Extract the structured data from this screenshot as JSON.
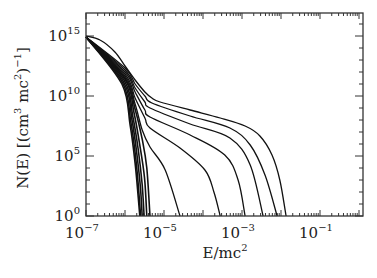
{
  "chart_data": {
    "type": "line",
    "title": "",
    "xlabel": "E/mc^2",
    "ylabel": "N(E) [(cm^3 mc^2)^-1]",
    "xscale": "log",
    "yscale": "log",
    "xlim": [
      1e-07,
      1.5
    ],
    "ylim": [
      1,
      3e+16
    ],
    "grid": false,
    "legend": null,
    "x_ticks": [
      {
        "value": 1e-07,
        "base": "10",
        "exp": "−7"
      },
      {
        "value": 1e-05,
        "base": "10",
        "exp": "−5"
      },
      {
        "value": 0.001,
        "base": "10",
        "exp": "−3"
      },
      {
        "value": 0.1,
        "base": "10",
        "exp": "−1"
      }
    ],
    "y_ticks": [
      {
        "value": 1,
        "base": "10",
        "exp": "0"
      },
      {
        "value": 100000.0,
        "base": "10",
        "exp": "5"
      },
      {
        "value": 10000000000.0,
        "base": "10",
        "exp": "10"
      },
      {
        "value": 1000000000000000.0,
        "base": "10",
        "exp": "15"
      }
    ],
    "series_units": "points given as [log10(E/mc^2), log10(N)]",
    "series": [
      {
        "name": "curve-1",
        "points": [
          [
            -7.0,
            15.0
          ],
          [
            -6.64,
            14.67
          ],
          [
            -6.26,
            13.67
          ],
          [
            -6.0,
            12.5
          ],
          [
            -5.74,
            11.33
          ],
          [
            -5.49,
            10.33
          ],
          [
            -5.31,
            9.83
          ],
          [
            -5.1,
            9.5
          ],
          [
            -4.33,
            8.83
          ],
          [
            -3.56,
            8.17
          ],
          [
            -2.92,
            7.5
          ],
          [
            -2.54,
            6.67
          ],
          [
            -2.23,
            5.08
          ],
          [
            -2.03,
            3.0
          ],
          [
            -1.87,
            0.0
          ]
        ]
      },
      {
        "name": "curve-2",
        "points": [
          [
            -7.0,
            14.92
          ],
          [
            -6.0,
            12.33
          ],
          [
            -5.74,
            11.0
          ],
          [
            -5.49,
            10.0
          ],
          [
            -5.31,
            9.42
          ],
          [
            -4.33,
            8.33
          ],
          [
            -3.31,
            7.33
          ],
          [
            -2.79,
            5.92
          ],
          [
            -2.41,
            3.42
          ],
          [
            -2.1,
            0.0
          ]
        ]
      },
      {
        "name": "curve-3",
        "points": [
          [
            -7.0,
            14.92
          ],
          [
            -6.0,
            12.17
          ],
          [
            -5.74,
            10.67
          ],
          [
            -5.49,
            9.5
          ],
          [
            -5.36,
            9.0
          ],
          [
            -4.33,
            7.67
          ],
          [
            -3.31,
            6.5
          ],
          [
            -2.79,
            4.25
          ],
          [
            -2.46,
            0.0
          ]
        ]
      },
      {
        "name": "curve-4",
        "points": [
          [
            -7.0,
            14.92
          ],
          [
            -6.0,
            12.0
          ],
          [
            -5.74,
            10.33
          ],
          [
            -5.49,
            8.83
          ],
          [
            -5.36,
            8.25
          ],
          [
            -4.33,
            6.75
          ],
          [
            -3.44,
            5.08
          ],
          [
            -3.1,
            3.0
          ],
          [
            -2.92,
            0.0
          ]
        ]
      },
      {
        "name": "curve-5",
        "points": [
          [
            -7.0,
            14.92
          ],
          [
            -6.0,
            11.83
          ],
          [
            -5.74,
            9.83
          ],
          [
            -5.49,
            8.17
          ],
          [
            -5.36,
            7.33
          ],
          [
            -4.59,
            5.67
          ],
          [
            -3.95,
            3.83
          ],
          [
            -3.72,
            2.0
          ],
          [
            -3.56,
            0.0
          ]
        ]
      },
      {
        "name": "curve-6",
        "points": [
          [
            -7.0,
            14.92
          ],
          [
            -6.0,
            11.67
          ],
          [
            -5.74,
            9.33
          ],
          [
            -5.56,
            7.17
          ],
          [
            -5.36,
            5.75
          ],
          [
            -4.97,
            3.83
          ],
          [
            -4.59,
            0.0
          ]
        ]
      },
      {
        "name": "curve-7",
        "points": [
          [
            -7.0,
            14.92
          ],
          [
            -6.0,
            11.5
          ],
          [
            -5.74,
            8.9
          ],
          [
            -5.56,
            6.4
          ],
          [
            -5.44,
            4.0
          ],
          [
            -5.36,
            0.0
          ]
        ]
      },
      {
        "name": "curve-8",
        "points": [
          [
            -7.0,
            14.92
          ],
          [
            -6.0,
            11.4
          ],
          [
            -5.77,
            8.6
          ],
          [
            -5.62,
            5.9
          ],
          [
            -5.5,
            3.2
          ],
          [
            -5.44,
            0.0
          ]
        ]
      },
      {
        "name": "curve-9",
        "points": [
          [
            -7.0,
            14.92
          ],
          [
            -6.02,
            11.3
          ],
          [
            -5.8,
            8.3
          ],
          [
            -5.66,
            5.5
          ],
          [
            -5.56,
            2.6
          ],
          [
            -5.51,
            0.0
          ]
        ]
      },
      {
        "name": "curve-10",
        "points": [
          [
            -7.0,
            14.92
          ],
          [
            -6.04,
            11.2
          ],
          [
            -5.82,
            8.0
          ],
          [
            -5.69,
            5.0
          ],
          [
            -5.6,
            2.2
          ],
          [
            -5.56,
            0.0
          ]
        ]
      },
      {
        "name": "curve-11",
        "points": [
          [
            -7.0,
            14.92
          ],
          [
            -6.06,
            11.1
          ],
          [
            -5.85,
            7.8
          ],
          [
            -5.72,
            4.7
          ],
          [
            -5.64,
            1.8
          ],
          [
            -5.6,
            0.0
          ]
        ]
      },
      {
        "name": "curve-12",
        "points": [
          [
            -7.0,
            14.92
          ],
          [
            -6.08,
            11.0
          ],
          [
            -5.87,
            7.6
          ],
          [
            -5.74,
            4.4
          ],
          [
            -5.66,
            1.5
          ],
          [
            -5.62,
            0.0
          ]
        ]
      }
    ]
  },
  "axes": {
    "xlabel_base": "E/mc",
    "xlabel_sup": "2",
    "ylabel_text": "N(E) [(cm",
    "ylabel_sup1": "3",
    "ylabel_mid": " mc",
    "ylabel_sup2": "2",
    "ylabel_close": ")",
    "ylabel_sup3": "−1",
    "ylabel_end": "]"
  },
  "style": {
    "line_color": "#111111",
    "frame_color": "#333333",
    "background": "#ffffff"
  }
}
